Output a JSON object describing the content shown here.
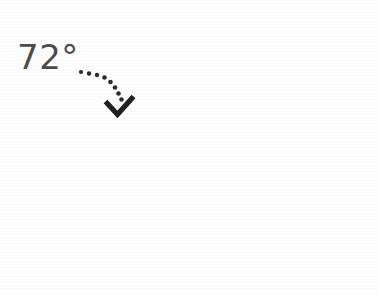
{
  "figure": {
    "title": "",
    "background_color": "#ffffff",
    "annotation": {
      "label": "72°",
      "label_text_color": "#4c4c4c",
      "leader_style": "dotted",
      "leader_color": "#2a2a2a",
      "arrowhead": "v-arrow-icon",
      "points_to_slice": "highlighted"
    },
    "colors": {
      "slice_major": "#d2d2d2",
      "slice_highlight": "#adadad",
      "outline": "#555555",
      "text": "#4c4c4c",
      "dots": "#2a2a2a"
    },
    "geometry": {
      "center_x": 222,
      "center_y": 147,
      "radius": 136,
      "highlight_start_deg": 122,
      "highlight_end_deg": 196
    }
  },
  "chart_data": {
    "type": "pie",
    "title": "",
    "subtitle": "",
    "xlabel": "",
    "ylabel": "",
    "grid": false,
    "legend_position": "none",
    "categories": [
      "Highlighted sector",
      "Remaining sector"
    ],
    "values": [
      72,
      288
    ],
    "units": "degrees",
    "percentages": [
      20,
      80
    ],
    "colors": [
      "#adadad",
      "#d2d2d2"
    ],
    "annotations": [
      {
        "text": "72°",
        "target": "Highlighted sector",
        "leader": "dotted-curve-with-arrow"
      }
    ],
    "total": 360
  }
}
